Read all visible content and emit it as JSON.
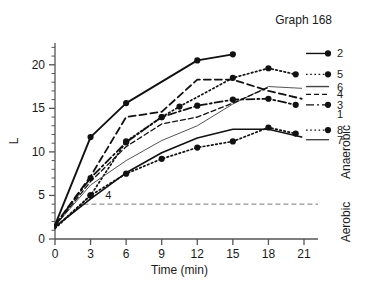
{
  "chart_data": {
    "type": "line",
    "title": "Graph 168",
    "xlabel": "Time (min)",
    "ylabel": "L",
    "xlim": [
      0,
      21
    ],
    "ylim": [
      0,
      22.5
    ],
    "xticks": [
      0,
      3,
      6,
      9,
      12,
      15,
      18,
      21
    ],
    "yticks": [
      0,
      5,
      10,
      15,
      20
    ],
    "yminorticks": [
      1,
      2,
      3,
      4,
      6,
      7,
      8,
      9,
      11,
      12,
      13,
      14,
      16,
      17,
      18,
      19,
      21,
      22
    ],
    "grid": false,
    "legend_position": "right-outside",
    "threshold": {
      "value": 4,
      "label": "4",
      "style": "dashed",
      "color": "#7a7a7a"
    },
    "side_labels": {
      "upper": "Anaerobic",
      "lower": "Aerobic"
    },
    "series": [
      {
        "name": "2",
        "label": "2",
        "style": "solid",
        "width": 1.9,
        "color": "#111111",
        "markers": true,
        "x": [
          0,
          3,
          6,
          12,
          15
        ],
        "y": [
          1.6,
          11.7,
          15.6,
          20.5,
          21.2
        ]
      },
      {
        "name": "5",
        "label": "5",
        "style": "dotted",
        "width": 1.7,
        "color": "#111111",
        "markers": true,
        "x": [
          0,
          3,
          6,
          9,
          10.5,
          15,
          18,
          20.3
        ],
        "y": [
          1.3,
          5.0,
          11.2,
          14.0,
          15.2,
          18.5,
          19.6,
          18.9
        ]
      },
      {
        "name": "6",
        "label": "6",
        "style": "solid",
        "width": 1.0,
        "color": "#555555",
        "markers": false,
        "x": [
          0,
          3,
          6,
          9,
          12,
          15,
          18,
          20.8
        ],
        "y": [
          1.5,
          6.2,
          9.0,
          11.3,
          13.0,
          15.5,
          17.5,
          17.3
        ]
      },
      {
        "name": "4",
        "label": "4",
        "style": "dashed",
        "width": 1.8,
        "color": "#111111",
        "markers": false,
        "x": [
          0,
          3,
          6,
          9,
          12,
          15,
          18,
          20.8
        ],
        "y": [
          1.6,
          7.2,
          14.0,
          14.6,
          18.3,
          18.3,
          17.0,
          16.1
        ]
      },
      {
        "name": "3",
        "label": "3",
        "style": "dashdot",
        "width": 1.8,
        "color": "#111111",
        "markers": true,
        "x": [
          0,
          3,
          6,
          9,
          12,
          15,
          18,
          20.3
        ],
        "y": [
          1.6,
          7.0,
          11.1,
          14.0,
          15.3,
          16.0,
          16.1,
          15.4
        ]
      },
      {
        "name": "1",
        "label": "1",
        "style": "dashed",
        "width": 1.3,
        "color": "#111111",
        "markers": false,
        "x": [
          0,
          3,
          6,
          9,
          12,
          15,
          18
        ],
        "y": [
          1.5,
          6.6,
          10.6,
          13.2,
          14.0,
          15.6,
          17.4
        ]
      },
      {
        "name": "8",
        "label": "8",
        "style": "solid",
        "width": 1.6,
        "color": "#111111",
        "markers": false,
        "x": [
          0,
          3,
          6,
          9,
          12,
          15,
          18,
          20.8
        ],
        "y": [
          1.4,
          4.6,
          7.6,
          9.9,
          11.6,
          12.6,
          12.6,
          11.7
        ]
      },
      {
        "name": "7",
        "label": "7",
        "style": "dotted",
        "width": 1.7,
        "color": "#111111",
        "markers": true,
        "x": [
          0,
          3,
          6,
          9,
          12,
          15,
          18,
          20.3
        ],
        "y": [
          1.2,
          5.0,
          7.5,
          9.2,
          10.5,
          11.2,
          12.8,
          12.1
        ]
      }
    ],
    "legend_entries": [
      {
        "label": "2",
        "style": "solid",
        "marker": true,
        "y": 21.3
      },
      {
        "label": "5",
        "style": "dotted",
        "marker": true,
        "y": 18.9
      },
      {
        "label": "6",
        "style": "solid",
        "marker": false,
        "y": 17.5
      },
      {
        "label": "4",
        "style": "dashed",
        "marker": false,
        "y": 16.6
      },
      {
        "label": "3",
        "style": "dashdot",
        "marker": true,
        "y": 15.4
      },
      {
        "label": "1",
        "style": "none",
        "marker": false,
        "y": 14.3
      },
      {
        "label": "8",
        "style": "dotted",
        "marker": true,
        "y": 12.5
      },
      {
        "label": "7",
        "style": "solid",
        "marker": false,
        "y": 11.4
      }
    ]
  }
}
